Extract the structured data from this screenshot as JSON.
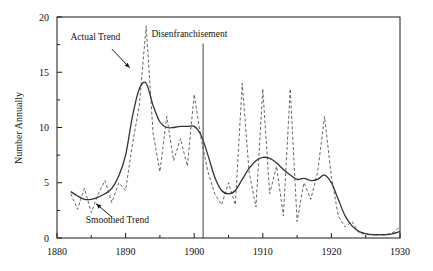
{
  "chart_data": {
    "type": "line",
    "title": "",
    "subtitle": "",
    "xlabel": "",
    "ylabel": "Number Annually",
    "xlim": [
      1880,
      1930
    ],
    "ylim": [
      0,
      20
    ],
    "xticks": [
      1880,
      1890,
      1900,
      1910,
      1920,
      1930
    ],
    "xtick_labels": [
      "1880",
      "1890",
      "1900",
      "1910",
      "1920",
      "1930"
    ],
    "xminor_ticks": [
      1885,
      1895,
      1905,
      1915,
      1925
    ],
    "yticks": [
      0,
      5,
      10,
      15,
      20
    ],
    "ytick_labels": [
      "0",
      "5",
      "10",
      "15",
      "20"
    ],
    "yminor_ticks": [
      2.5,
      7.5,
      12.5,
      17.5
    ],
    "grid": false,
    "legend": "none",
    "series": [
      {
        "name": "Actual Trend",
        "style": "dashed",
        "color": "#555555",
        "x": [
          1882,
          1883,
          1884,
          1885,
          1886,
          1887,
          1888,
          1889,
          1890,
          1891,
          1892,
          1893,
          1894,
          1895,
          1896,
          1897,
          1898,
          1899,
          1900,
          1901,
          1902,
          1903,
          1904,
          1905,
          1906,
          1907,
          1908,
          1909,
          1910,
          1911,
          1912,
          1913,
          1914,
          1915,
          1916,
          1917,
          1918,
          1919,
          1920,
          1921,
          1922,
          1923,
          1924,
          1925,
          1926,
          1927,
          1928,
          1929,
          1930
        ],
        "values": [
          4.0,
          2.6,
          4.5,
          2.3,
          4.0,
          5.2,
          3.2,
          5.0,
          4.3,
          8.5,
          12.0,
          19.2,
          9.5,
          6.0,
          11.0,
          7.0,
          9.0,
          6.5,
          13.0,
          9.0,
          6.0,
          4.0,
          3.0,
          5.0,
          3.0,
          14.0,
          6.0,
          2.8,
          13.5,
          4.0,
          6.5,
          2.0,
          13.5,
          1.5,
          5.0,
          3.5,
          6.0,
          11.0,
          5.5,
          2.0,
          1.0,
          1.5,
          0.5,
          0.3,
          0.3,
          0.3,
          0.3,
          0.5,
          1.0
        ]
      },
      {
        "name": "Smoothed Trend",
        "style": "solid",
        "color": "#333333",
        "x": [
          1882,
          1883,
          1884,
          1885,
          1886,
          1887,
          1888,
          1889,
          1890,
          1891,
          1892,
          1893,
          1894,
          1895,
          1896,
          1897,
          1898,
          1899,
          1900,
          1901,
          1902,
          1903,
          1904,
          1905,
          1906,
          1907,
          1908,
          1909,
          1910,
          1911,
          1912,
          1913,
          1914,
          1915,
          1916,
          1917,
          1918,
          1919,
          1920,
          1921,
          1922,
          1923,
          1924,
          1925,
          1926,
          1927,
          1928,
          1929,
          1930
        ],
        "values": [
          4.2,
          3.8,
          3.5,
          3.5,
          3.7,
          4.0,
          4.5,
          5.6,
          7.5,
          11.0,
          13.5,
          14.0,
          12.0,
          10.5,
          10.0,
          10.0,
          10.1,
          10.1,
          10.1,
          9.3,
          7.5,
          5.5,
          4.3,
          4.0,
          4.3,
          5.3,
          6.3,
          7.0,
          7.3,
          7.2,
          6.8,
          6.2,
          5.7,
          5.3,
          5.4,
          5.2,
          5.3,
          5.7,
          5.0,
          3.5,
          2.0,
          1.1,
          0.6,
          0.4,
          0.3,
          0.3,
          0.3,
          0.4,
          0.6
        ]
      }
    ],
    "annotations": [
      {
        "name": "actual-trend",
        "text": "Actual Trend",
        "text_x": 1885.6,
        "text_y": 17.9,
        "arrow_from_x": 1888.0,
        "arrow_from_y": 17.1,
        "arrow_to_x": 1890.6,
        "arrow_to_y": 15.4
      },
      {
        "name": "smoothed-trend",
        "text": "Smoothed Trend",
        "text_x": 1888.8,
        "text_y": 1.4,
        "arrow_from_x": 1888.0,
        "arrow_from_y": 1.9,
        "arrow_to_x": 1885.7,
        "arrow_to_y": 3.1
      },
      {
        "name": "disenfranchisement",
        "text": "Disenfranchisement",
        "text_x": 1899.3,
        "text_y": 18.2,
        "vline_x": 1901.3,
        "vline_y_top": 17.6,
        "vline_y_bottom": 0
      }
    ]
  }
}
